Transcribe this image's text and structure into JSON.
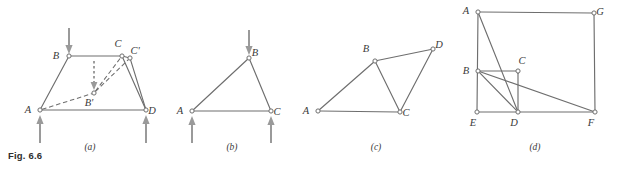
{
  "figure": {
    "number_label": "Fig. 6.6",
    "stroke_color": "#6e6e6e",
    "load_arrow_color": "#9a9a9a",
    "node_fill": "#ffffff",
    "label_color": "#3a3a3a"
  },
  "panels": [
    {
      "caption": "(a)",
      "caption_x": 90,
      "caption_y": 150,
      "nodes": [
        {
          "id": "A",
          "label": "A",
          "x": 40,
          "y": 110,
          "label_x": 28,
          "label_y": 113
        },
        {
          "id": "B",
          "label": "B",
          "x": 69,
          "y": 56,
          "label_x": 56,
          "label_y": 59
        },
        {
          "id": "C",
          "label": "C",
          "x": 122,
          "y": 56,
          "label_x": 118,
          "label_y": 47
        },
        {
          "id": "Cp",
          "label": "C'",
          "x": 130,
          "y": 58,
          "label_x": 135,
          "label_y": 54
        },
        {
          "id": "D",
          "label": "D",
          "x": 146,
          "y": 110,
          "label_x": 152,
          "label_y": 114
        },
        {
          "id": "Bp",
          "label": "B'",
          "x": 94,
          "y": 93,
          "label_x": 89,
          "label_y": 106
        }
      ],
      "solid_edges": [
        {
          "from": "A",
          "to": "B"
        },
        {
          "from": "B",
          "to": "C"
        },
        {
          "from": "C",
          "to": "D"
        },
        {
          "from": "A",
          "to": "D"
        },
        {
          "from": "C",
          "to": "Cp"
        },
        {
          "from": "Cp",
          "to": "D"
        }
      ],
      "dashed_edges": [
        {
          "from": "A",
          "to": "Bp"
        },
        {
          "from": "Bp",
          "to": "C"
        },
        {
          "from": "Bp",
          "to": "Cp"
        }
      ],
      "load_arrows": [
        {
          "name": "load-arrow-down-b",
          "direction": "down",
          "x": 69,
          "y1": 28,
          "y2": 54
        },
        {
          "name": "load-arrow-up-a",
          "direction": "up",
          "x": 40,
          "y1": 143,
          "y2": 115
        },
        {
          "name": "load-arrow-up-d",
          "direction": "up",
          "x": 146,
          "y1": 143,
          "y2": 115
        }
      ],
      "dashed_load_arrows": [
        {
          "name": "load-arrow-dashed-down-b",
          "direction": "down",
          "x": 94,
          "y1": 61,
          "y2": 90
        }
      ]
    },
    {
      "caption": "(b)",
      "caption_x": 232,
      "caption_y": 150,
      "nodes": [
        {
          "id": "A",
          "label": "A",
          "x": 192,
          "y": 111,
          "label_x": 180,
          "label_y": 114
        },
        {
          "id": "B",
          "label": "B",
          "x": 249,
          "y": 58,
          "label_x": 255,
          "label_y": 56
        },
        {
          "id": "C",
          "label": "C",
          "x": 271,
          "y": 111,
          "label_x": 277,
          "label_y": 115
        }
      ],
      "solid_edges": [
        {
          "from": "A",
          "to": "B"
        },
        {
          "from": "B",
          "to": "C"
        },
        {
          "from": "A",
          "to": "C"
        }
      ],
      "dashed_edges": [],
      "load_arrows": [
        {
          "name": "load-arrow-down-b",
          "direction": "down",
          "x": 249,
          "y1": 30,
          "y2": 55
        },
        {
          "name": "load-arrow-up-a",
          "direction": "up",
          "x": 192,
          "y1": 143,
          "y2": 116
        },
        {
          "name": "load-arrow-up-c",
          "direction": "up",
          "x": 271,
          "y1": 143,
          "y2": 116
        }
      ],
      "dashed_load_arrows": []
    },
    {
      "caption": "(c)",
      "caption_x": 376,
      "caption_y": 150,
      "nodes": [
        {
          "id": "A",
          "label": "A",
          "x": 318,
          "y": 111,
          "label_x": 306,
          "label_y": 114
        },
        {
          "id": "B",
          "label": "B",
          "x": 375,
          "y": 61,
          "label_x": 366,
          "label_y": 52
        },
        {
          "id": "C",
          "label": "C",
          "x": 400,
          "y": 112,
          "label_x": 406,
          "label_y": 116
        },
        {
          "id": "D",
          "label": "D",
          "x": 433,
          "y": 49,
          "label_x": 439,
          "label_y": 48
        }
      ],
      "solid_edges": [
        {
          "from": "A",
          "to": "B"
        },
        {
          "from": "B",
          "to": "D"
        },
        {
          "from": "B",
          "to": "C"
        },
        {
          "from": "C",
          "to": "D"
        },
        {
          "from": "A",
          "to": "C"
        }
      ],
      "dashed_edges": [],
      "load_arrows": [],
      "dashed_load_arrows": []
    },
    {
      "caption": "(d)",
      "caption_x": 535,
      "caption_y": 150,
      "nodes": [
        {
          "id": "A",
          "label": "A",
          "x": 478,
          "y": 12,
          "label_x": 466,
          "label_y": 14
        },
        {
          "id": "G",
          "label": "G",
          "x": 594,
          "y": 13,
          "label_x": 600,
          "label_y": 15
        },
        {
          "id": "B",
          "label": "B",
          "x": 478,
          "y": 71,
          "label_x": 466,
          "label_y": 74
        },
        {
          "id": "C",
          "label": "C",
          "x": 518,
          "y": 71,
          "label_x": 522,
          "label_y": 64
        },
        {
          "id": "E",
          "label": "E",
          "x": 477,
          "y": 112,
          "label_x": 473,
          "label_y": 126
        },
        {
          "id": "D",
          "label": "D",
          "x": 518,
          "y": 112,
          "label_x": 514,
          "label_y": 126
        },
        {
          "id": "F",
          "label": "F",
          "x": 595,
          "y": 112,
          "label_x": 591,
          "label_y": 126
        }
      ],
      "solid_edges": [
        {
          "from": "A",
          "to": "G"
        },
        {
          "from": "A",
          "to": "E"
        },
        {
          "from": "G",
          "to": "F"
        },
        {
          "from": "E",
          "to": "F"
        },
        {
          "from": "B",
          "to": "C"
        },
        {
          "from": "C",
          "to": "D"
        },
        {
          "from": "A",
          "to": "D"
        },
        {
          "from": "B",
          "to": "F"
        },
        {
          "from": "B",
          "to": "D"
        }
      ],
      "dashed_edges": [],
      "load_arrows": [],
      "dashed_load_arrows": []
    }
  ]
}
